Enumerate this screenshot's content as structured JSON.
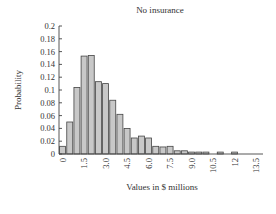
{
  "chart_data": {
    "type": "bar",
    "title": "No insurance",
    "xlabel": "Values in $ millions",
    "ylabel": "Probability",
    "ylim": [
      0,
      0.2
    ],
    "yticks": [
      0,
      0.02,
      0.04,
      0.06,
      0.08,
      0.1,
      0.12,
      0.14,
      0.16,
      0.18,
      0.2
    ],
    "ytick_labels": [
      "0",
      "0.02",
      "0.04",
      "0.06",
      "0.08",
      "0.1",
      "0.12",
      "0.14",
      "0.16",
      "0.18",
      "0.2"
    ],
    "xlim": [
      0,
      14.5
    ],
    "xticks": [
      0,
      1.5,
      3.0,
      4.5,
      6.0,
      7.5,
      9.0,
      10.5,
      12,
      13.5
    ],
    "xtick_labels": [
      "0",
      "1.5",
      "3.0",
      "4.5",
      "6.0",
      "7.5",
      "9.0",
      "10.5",
      "12",
      "13.5"
    ],
    "bin_width": 0.5,
    "x": [
      0,
      0.5,
      1.0,
      1.5,
      2.0,
      2.5,
      3.0,
      3.5,
      4.0,
      4.5,
      5.0,
      5.5,
      6.0,
      6.5,
      7.0,
      7.5,
      8.0,
      8.5,
      9.0,
      9.5,
      10.0,
      10.5,
      11.0,
      11.5,
      12.0
    ],
    "values": [
      0.012,
      0.05,
      0.104,
      0.153,
      0.154,
      0.113,
      0.11,
      0.084,
      0.062,
      0.04,
      0.025,
      0.028,
      0.025,
      0.012,
      0.011,
      0.012,
      0.005,
      0.005,
      0.003,
      0.003,
      0.003,
      0.0,
      0.003,
      0.0,
      0.003
    ],
    "grid": false,
    "legend": "none"
  }
}
